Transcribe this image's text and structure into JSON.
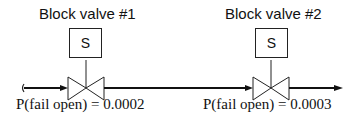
{
  "diagram": {
    "valves": [
      {
        "title": "Block valve #1",
        "actuator_label": "S",
        "probability_label": "P(fail open) = 0.0002"
      },
      {
        "title": "Block valve #2",
        "actuator_label": "S",
        "probability_label": "P(fail open) = 0.0003"
      }
    ],
    "line_color": "#111111"
  }
}
